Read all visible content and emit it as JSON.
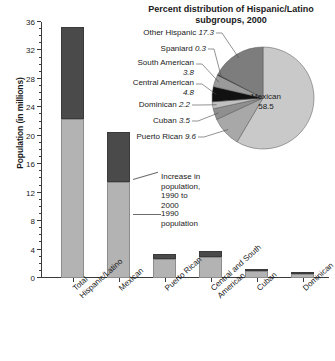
{
  "chart_data": [
    {
      "type": "bar",
      "id": "population-bar-chart",
      "title": "",
      "xlabel": "",
      "ylabel": "Population (in millions)",
      "ylim": [
        0,
        36
      ],
      "ytick_step": 4,
      "yticks": [
        "0",
        "4",
        "8",
        "12",
        "16",
        "20",
        "24",
        "28",
        "32",
        "36"
      ],
      "categories": [
        "Total\nHispanic/Latino",
        "Mexican",
        "Puerto Rican",
        "Central and South\nAmerican",
        "Cuban",
        "Dominican"
      ],
      "series": [
        {
          "name": "1990 population",
          "values": [
            22.4,
            13.5,
            2.7,
            3.0,
            1.05,
            0.52
          ]
        },
        {
          "name": "Increase in population, 1990 to 2000",
          "values": [
            12.9,
            7.1,
            0.7,
            0.8,
            0.19,
            0.25
          ]
        }
      ],
      "totals": [
        35.3,
        20.6,
        3.4,
        3.8,
        1.24,
        0.77
      ],
      "annotations": [
        "Increase in population,\n1990 to 2000",
        "1990 population"
      ],
      "grid": false,
      "legend_position": "inline-annotation"
    },
    {
      "type": "pie",
      "id": "hispanic-subgroups-pie",
      "title": "Percent distribution of Hispanic/Latino\nsubgroups, 2000",
      "labels": [
        "Mexican",
        "Puerto Rican",
        "Cuban",
        "Dominican",
        "Central American",
        "South American",
        "Spaniard",
        "Other Hispanic"
      ],
      "values": [
        58.5,
        9.6,
        3.5,
        2.2,
        4.8,
        3.8,
        0.3,
        17.3
      ],
      "units": "percent",
      "legend_position": "leader-labels"
    }
  ],
  "bar": {
    "ylabel": "Population (in millions)",
    "yticks": [
      "36",
      "32",
      "28",
      "24",
      "20",
      "16",
      "12",
      "8",
      "4",
      "0"
    ],
    "categories": [
      {
        "line1": "Total",
        "line2": "Hispanic/Latino"
      },
      {
        "line1": "Mexican",
        "line2": ""
      },
      {
        "line1": "Puerto Rican",
        "line2": ""
      },
      {
        "line1": "Central and South",
        "line2": "American"
      },
      {
        "line1": "Cuban",
        "line2": ""
      },
      {
        "line1": "Dominican",
        "line2": ""
      }
    ],
    "annotation_increase_l1": "Increase in population,",
    "annotation_increase_l2": "1990 to 2000",
    "annotation_1990": "1990 population"
  },
  "pie": {
    "title_l1": "Percent distribution of Hispanic/Latino",
    "title_l2": "subgroups, 2000",
    "center_label_name": "Mexican",
    "center_label_value": "58.5",
    "labels": [
      {
        "name": "Other Hispanic",
        "value": "17.3"
      },
      {
        "name": "Spaniard",
        "value": "0.3"
      },
      {
        "name": "South American",
        "value": "3.8"
      },
      {
        "name": "Central American",
        "value": "4.8"
      },
      {
        "name": "Dominican",
        "value": "2.2"
      },
      {
        "name": "Cuban",
        "value": "3.5"
      },
      {
        "name": "Puerto Rican",
        "value": "9.6"
      }
    ]
  },
  "colors": {
    "light_gray": "#b3b3b3",
    "dark_gray": "#4a4a4a",
    "mid_gray": "#8c8c8c",
    "black": "#1a1a1a",
    "pale_gray": "#c9c9c9",
    "axis": "#3a3a3a"
  }
}
